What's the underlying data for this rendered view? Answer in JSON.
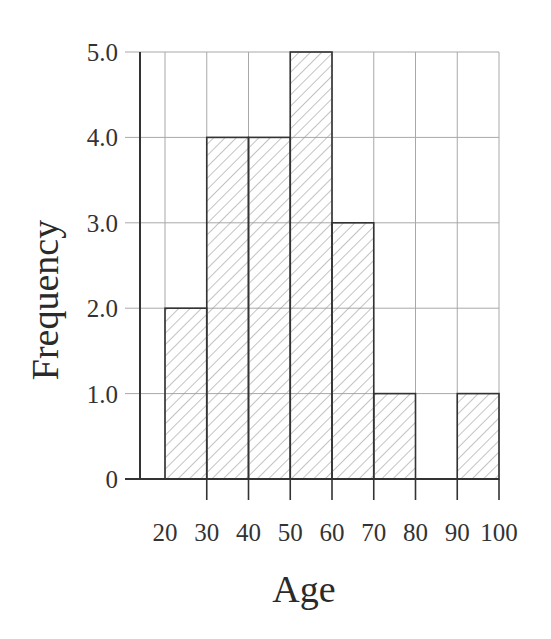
{
  "chart_data": {
    "type": "bar",
    "subtype": "histogram",
    "title": "",
    "xlabel": "Age",
    "ylabel": "Frequency",
    "bins": [
      {
        "from": 20,
        "to": 30,
        "value": 2
      },
      {
        "from": 30,
        "to": 40,
        "value": 4
      },
      {
        "from": 40,
        "to": 50,
        "value": 4
      },
      {
        "from": 50,
        "to": 60,
        "value": 5
      },
      {
        "from": 60,
        "to": 70,
        "value": 3
      },
      {
        "from": 70,
        "to": 80,
        "value": 1
      },
      {
        "from": 80,
        "to": 90,
        "value": 0
      },
      {
        "from": 90,
        "to": 100,
        "value": 1
      }
    ],
    "categories": [
      "20-30",
      "30-40",
      "40-50",
      "50-60",
      "60-70",
      "70-80",
      "80-90",
      "90-100"
    ],
    "values": [
      2,
      4,
      4,
      5,
      3,
      1,
      0,
      1
    ],
    "x_ticks": [
      "20",
      "30",
      "40",
      "50",
      "60",
      "70",
      "80",
      "90",
      "100"
    ],
    "y_ticks": [
      "0",
      "1.0",
      "2.0",
      "3.0",
      "4.0",
      "5.0"
    ],
    "xlim": [
      20,
      100
    ],
    "ylim": [
      0,
      5
    ],
    "grid": true,
    "legend": null,
    "bar_fill": "diagonal hatch",
    "colors": {
      "bar_edge": "#333333",
      "hatch": "#9a9a9a",
      "grid": "#a8a8a8",
      "axis": "#333333"
    }
  }
}
